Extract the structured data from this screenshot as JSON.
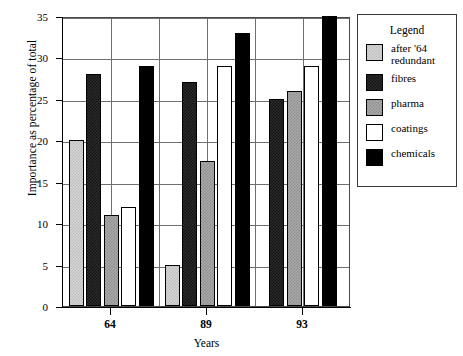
{
  "chart_data": {
    "type": "bar",
    "title": "",
    "xlabel": "Years",
    "ylabel": "Importance as percentage of total",
    "categories": [
      "64",
      "89",
      "93"
    ],
    "ylim": [
      0,
      35
    ],
    "yticks": [
      0,
      5,
      10,
      15,
      20,
      25,
      30,
      35
    ],
    "grid": true,
    "legend_position": "right",
    "legend_title": "Legend",
    "series": [
      {
        "name": "after '64 redundant",
        "color": "#d4d4d4",
        "values": [
          20,
          5,
          null
        ]
      },
      {
        "name": "fibres",
        "color": "#2b2b2b",
        "values": [
          28,
          27,
          25
        ]
      },
      {
        "name": "pharma",
        "color": "#a9a9a9",
        "values": [
          11,
          17.5,
          26
        ]
      },
      {
        "name": "coatings",
        "color": "#ffffff",
        "values": [
          12,
          29,
          29
        ]
      },
      {
        "name": "chemicals",
        "color": "#000000",
        "values": [
          29,
          33,
          35
        ]
      }
    ]
  },
  "axis": {
    "y_tick_labels": [
      "0",
      "5",
      "10",
      "15",
      "20",
      "25",
      "30",
      "35"
    ],
    "x_tick_labels": [
      "64",
      "89",
      "93"
    ],
    "y_title": "Importance as percentage of total",
    "x_title": "Years"
  },
  "legend": {
    "title": "Legend",
    "items": [
      {
        "label": "after '64\nredundant",
        "label_line1": "after '64",
        "label_line2": "redundant",
        "swatch": "after"
      },
      {
        "label": "fibres",
        "swatch": "fibres"
      },
      {
        "label": "pharma",
        "swatch": "pharma"
      },
      {
        "label": "coatings",
        "swatch": "coatings"
      },
      {
        "label": "chemicals",
        "swatch": "chemicals"
      }
    ]
  }
}
